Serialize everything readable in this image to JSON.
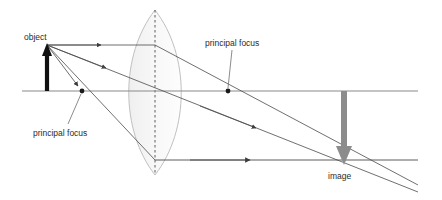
{
  "diagram": {
    "type": "optics-ray-diagram",
    "canvas": {
      "width": 442,
      "height": 200
    },
    "colors": {
      "background": "#ffffff",
      "axis": "#8a8a8a",
      "ray": "#4a4a4a",
      "lens_outline": "#b8b8b8",
      "lens_fill": "#f2f2f2",
      "object_arrow": "#111111",
      "image_arrow": "#8c8c8c",
      "focus_dot": "#1a1a1a",
      "leader_line": "#6e6e6e",
      "text": "#2b2b2b"
    },
    "labels": {
      "object": "object",
      "principal_focus_left": "principal focus",
      "principal_focus_right": "principal focus",
      "image": "image"
    },
    "geometry": {
      "optical_axis": {
        "x1": 22,
        "y1": 91,
        "x2": 418,
        "y2": 91
      },
      "lens": {
        "center_x": 155,
        "center_y": 91,
        "top_y": 10,
        "bottom_y": 175,
        "half_width": 22
      },
      "object": {
        "x": 47,
        "base_y": 91,
        "tip_y": 45,
        "height": 46,
        "direction": "up"
      },
      "image": {
        "x": 344,
        "base_y": 91,
        "tip_y": 163,
        "height": 72,
        "direction": "down",
        "inverted": true
      },
      "focal_points": [
        {
          "name": "left-focus",
          "x": 82,
          "y": 91
        },
        {
          "name": "right-focus",
          "x": 228,
          "y": 91
        }
      ],
      "rays": [
        {
          "name": "parallel-ray",
          "from": [
            47,
            45
          ],
          "to": [
            155,
            45
          ],
          "then": [
            344,
            163
          ]
        },
        {
          "name": "center-ray",
          "from": [
            47,
            45
          ],
          "to": [
            344,
            163
          ]
        },
        {
          "name": "focal-ray",
          "from": [
            47,
            45
          ],
          "to": [
            82,
            91
          ],
          "then": [
            155,
            160
          ],
          "continues": [
            344,
            160
          ]
        }
      ]
    }
  }
}
